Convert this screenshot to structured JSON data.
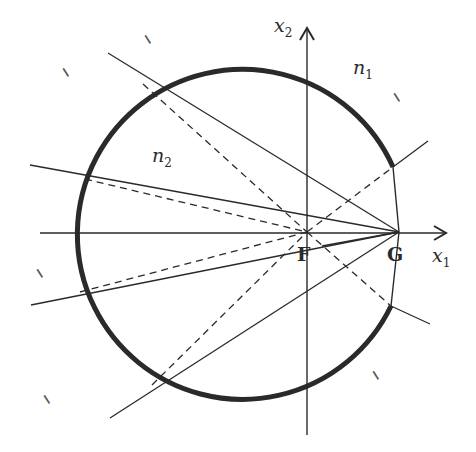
{
  "diagram": {
    "axes": {
      "x1": {
        "label": "x",
        "sub": "1"
      },
      "x2": {
        "label": "x",
        "sub": "2"
      }
    },
    "points": {
      "F": "F",
      "G": "G"
    },
    "regions": {
      "n1": {
        "label": "n",
        "sub": "1"
      },
      "n2": {
        "label": "n",
        "sub": "2"
      }
    },
    "hatch_marks": [
      "//",
      "//",
      "//",
      "//",
      "//",
      "//"
    ],
    "colors": {
      "ink": "#2a2a2a",
      "background": "#ffffff"
    }
  }
}
